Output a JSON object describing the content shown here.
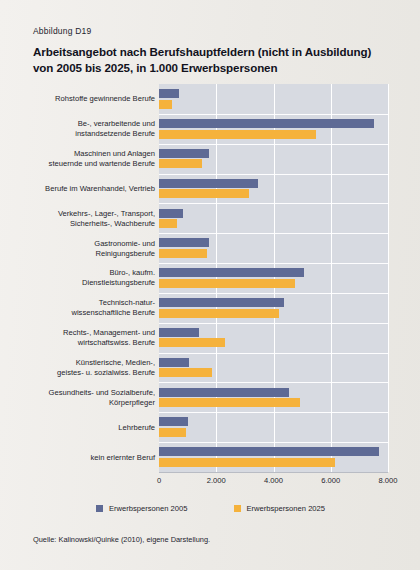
{
  "figure": {
    "label": "Abbildung D19",
    "title_line1": "Arbeitsangebot nach Berufshauptfeldern (nicht in Ausbildung)",
    "title_line2": "von 2005 bis 2025, in 1.000 Erwerbspersonen",
    "source": "Quelle: Kalinowski/Quinke (2010), eigene Darstellung."
  },
  "legend": {
    "items": [
      {
        "label": "Erwerbspersonen 2005",
        "color": "#5e6a95"
      },
      {
        "label": "Erwerbspersonen 2025",
        "color": "#f5b23c"
      }
    ]
  },
  "colors": {
    "series_2005": "#5e6a95",
    "series_2025": "#f5b23c",
    "plot_background": "#d7dae1",
    "page_background": "#efedea",
    "gridline": "#ffffff"
  },
  "chart_data": {
    "type": "bar",
    "orientation": "horizontal",
    "title": "Arbeitsangebot nach Berufshauptfeldern (nicht in Ausbildung) von 2005 bis 2025, in 1.000 Erwerbspersonen",
    "xlabel": "",
    "ylabel": "",
    "xlim": [
      0,
      8000
    ],
    "xticks": [
      0,
      2000,
      4000,
      6000,
      8000
    ],
    "xticklabels": [
      "0",
      "2.000",
      "4.000",
      "6.000",
      "8.000"
    ],
    "grid": true,
    "legend_position": "bottom",
    "categories": [
      "Rohstoffe gewinnende Berufe",
      "Be-, verarbeitende und instandsetzende Berufe",
      "Maschinen und Anlagen steuernde und wartende Berufe",
      "Berufe im Warenhandel, Vertrieb",
      "Verkehrs-, Lager-, Transport, Sicherheits-, Wachberufe",
      "Gastronomie- und Reinigungsberufe",
      "Büro-, kaufm. Dienstleistungsberufe",
      "Technisch-natur- wissenschaftliche Berufe",
      "Rechts-, Management- und wirtschaftswiss. Berufe",
      "Künstlerische, Medien-, geistes- u. sozialwiss. Berufe",
      "Gesundheits- und Sozialberufe, Körperpfleger",
      "Lehrberufe",
      "kein erlernter Beruf"
    ],
    "category_lines": [
      [
        "Rohstoffe gewinnende Berufe"
      ],
      [
        "Be-, verarbeitende und",
        "instandsetzende Berufe"
      ],
      [
        "Maschinen und Anlagen",
        "steuernde und wartende Berufe"
      ],
      [
        "Berufe im Warenhandel, Vertrieb"
      ],
      [
        "Verkehrs-, Lager-, Transport,",
        "Sicherheits-, Wachberufe"
      ],
      [
        "Gastronomie- und",
        "Reinigungsberufe"
      ],
      [
        "Büro-, kaufm.",
        "Dienstleistungsberufe"
      ],
      [
        "Technisch-natur-",
        "wissenschaftliche Berufe"
      ],
      [
        "Rechts-, Management- und",
        "wirtschaftswiss. Berufe"
      ],
      [
        "Künstlerische, Medien-,",
        "geistes- u. sozialwiss. Berufe"
      ],
      [
        "Gesundheits- und Sozialberufe,",
        "Körperpfleger"
      ],
      [
        "Lehrberufe"
      ],
      [
        "kein erlernter Beruf"
      ]
    ],
    "series": [
      {
        "name": "Erwerbspersonen 2005",
        "color": "#5e6a95",
        "values": [
          700,
          7500,
          1750,
          3450,
          840,
          1750,
          5050,
          4350,
          1400,
          1050,
          4550,
          1000,
          7700
        ]
      },
      {
        "name": "Erwerbspersonen 2025",
        "color": "#f5b23c",
        "values": [
          450,
          5500,
          1500,
          3150,
          620,
          1680,
          4740,
          4200,
          2300,
          1850,
          4940,
          950,
          6150
        ]
      }
    ]
  }
}
